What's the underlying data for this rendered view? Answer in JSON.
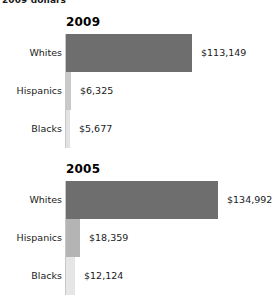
{
  "subtitle": "2009 dollars",
  "chart_data": {
    "type": "bar",
    "orientation": "horizontal",
    "title": "",
    "subtitle": "2009 dollars",
    "xlabel": "",
    "ylabel": "",
    "grid": false,
    "legend": "none",
    "xlim": [
      0,
      134992
    ],
    "panels": [
      {
        "panel_label": "2009",
        "categories": [
          "Whites",
          "Hispanics",
          "Blacks"
        ],
        "values": [
          113149,
          6325,
          5677
        ],
        "value_labels": [
          "$113,149",
          "$6,325",
          "$5,677"
        ],
        "bar_colors": [
          "#6e6e6e",
          "#c9c9c9",
          "#e2e2e2"
        ],
        "bar_pixel_widths": [
          126,
          5,
          4
        ]
      },
      {
        "panel_label": "2005",
        "categories": [
          "Whites",
          "Hispanics",
          "Blacks"
        ],
        "values": [
          134992,
          18359,
          12124
        ],
        "value_labels": [
          "$134,992",
          "$18,359",
          "$12,124"
        ],
        "bar_colors": [
          "#6e6e6e",
          "#b4b4b4",
          "#e6e6e6"
        ],
        "bar_pixel_widths": [
          152,
          14,
          9
        ]
      }
    ]
  }
}
